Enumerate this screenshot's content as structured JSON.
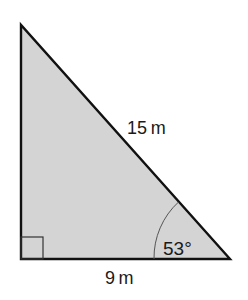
{
  "diagram": {
    "type": "right-triangle",
    "fill_color": "#d4d4d4",
    "stroke_color": "#111111",
    "vertices": {
      "top": [
        21,
        25
      ],
      "right_angle": [
        21,
        259
      ],
      "bottom_right": [
        230,
        259
      ]
    },
    "labels": {
      "hypotenuse": "15 m",
      "base": "9 m",
      "angle": "53°"
    },
    "right_angle_marker": true
  }
}
